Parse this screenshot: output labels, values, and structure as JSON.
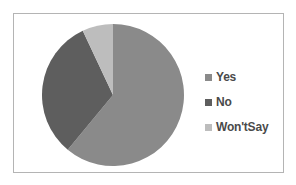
{
  "chart_data": {
    "type": "pie",
    "title": "",
    "categories": [
      "Yes",
      "No",
      "Won't Say"
    ],
    "values": [
      61,
      32,
      7
    ],
    "unit": "percent (estimated from slice angles)",
    "colors": [
      "#8a8a8a",
      "#5e5e5e",
      "#bdbdbd"
    ],
    "start_angle_deg": 0,
    "direction": "clockwise",
    "legend_position": "right",
    "data_labels": false
  },
  "legend": {
    "items": [
      {
        "label": "Yes",
        "color": "#8a8a8a"
      },
      {
        "label": "No",
        "color": "#5e5e5e"
      },
      {
        "label": "Won'tSay",
        "color": "#bdbdbd"
      }
    ]
  }
}
